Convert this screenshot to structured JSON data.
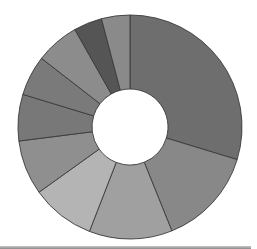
{
  "chart_data": {
    "type": "pie",
    "variant": "donut",
    "title": "",
    "legend": "none",
    "start_angle_deg": 0,
    "direction": "clockwise",
    "categories": [
      "Slice 1",
      "Slice 2",
      "Slice 3",
      "Slice 4",
      "Slice 5",
      "Slice 6",
      "Slice 7",
      "Slice 8",
      "Slice 9",
      "Slice 10"
    ],
    "values": [
      29.7,
      14.2,
      12.0,
      9.2,
      7.9,
      6.7,
      5.8,
      6.3,
      4.1,
      4.1
    ],
    "colors": [
      "#6e6e6e",
      "#888888",
      "#a0a0a0",
      "#b4b4b4",
      "#8f8f8f",
      "#787878",
      "#7a7a7a",
      "#8c8c8c",
      "#555555",
      "#8a8a8a"
    ],
    "stroke_color": "#3a3a3a",
    "geometry": {
      "cx": 130,
      "cy": 127,
      "outer_radius": 112,
      "inner_radius": 38
    }
  }
}
